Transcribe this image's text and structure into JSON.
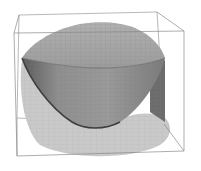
{
  "figure": {
    "colors": {
      "background": "#ffffff",
      "box_line": "#8a8a8a",
      "dome_fill": "#a8a8a8",
      "bowl_fill": "#8c8c8c",
      "bowl_dark": "#4a4a4a",
      "side_fill": "#6e6e6e",
      "shadow_fill": "#c8c8c8",
      "mesh_line": "#7a7a7a"
    }
  }
}
